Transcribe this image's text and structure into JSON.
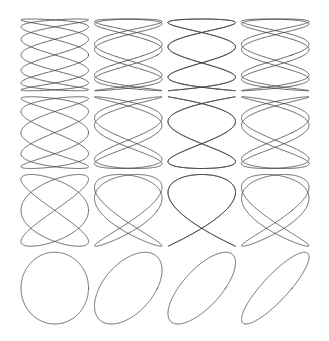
{
  "figure": {
    "background_color": "#ffffff",
    "stroke_color": "#3c3c3c",
    "stroke_width": 0.8,
    "canvas": {
      "width": 329,
      "height": 341
    },
    "grid": {
      "rows": 4,
      "cols": 4
    }
  },
  "chart_data": {
    "type": "line",
    "title": "",
    "subtitle": "",
    "xlabel": "",
    "ylabel": "",
    "grid": false,
    "legend": "none",
    "axis_visible": false,
    "tick_labels": [],
    "parametric": true,
    "equations": {
      "x": "A * sin(a * t + delta)",
      "y": "B * sin(b * t)",
      "t_range": [
        0,
        6.283185307179586
      ],
      "samples": 1200
    },
    "plot_area": {
      "x0": 18,
      "y0": 16,
      "x1": 312,
      "y1": 327
    },
    "cell_size": {
      "width": 73.5,
      "height": 77.75
    },
    "cell_padding": 3,
    "row_frequency_ratios": [
      "7:2",
      "5:2",
      "3:2",
      "1:1"
    ],
    "col_phase_deltas_deg": [
      90,
      60,
      45,
      30
    ],
    "panels": [
      {
        "row": 0,
        "col": 0,
        "a": 7,
        "b": 2,
        "delta_deg": 90,
        "ratio": "7:2"
      },
      {
        "row": 0,
        "col": 1,
        "a": 7,
        "b": 2,
        "delta_deg": 60,
        "ratio": "7:2"
      },
      {
        "row": 0,
        "col": 2,
        "a": 7,
        "b": 2,
        "delta_deg": 45,
        "ratio": "7:2"
      },
      {
        "row": 0,
        "col": 3,
        "a": 7,
        "b": 2,
        "delta_deg": 30,
        "ratio": "7:2"
      },
      {
        "row": 1,
        "col": 0,
        "a": 5,
        "b": 2,
        "delta_deg": 90,
        "ratio": "5:2"
      },
      {
        "row": 1,
        "col": 1,
        "a": 5,
        "b": 2,
        "delta_deg": 60,
        "ratio": "5:2"
      },
      {
        "row": 1,
        "col": 2,
        "a": 5,
        "b": 2,
        "delta_deg": 45,
        "ratio": "5:2"
      },
      {
        "row": 1,
        "col": 3,
        "a": 5,
        "b": 2,
        "delta_deg": 30,
        "ratio": "5:2"
      },
      {
        "row": 2,
        "col": 0,
        "a": 3,
        "b": 2,
        "delta_deg": 90,
        "ratio": "3:2"
      },
      {
        "row": 2,
        "col": 1,
        "a": 3,
        "b": 2,
        "delta_deg": 60,
        "ratio": "3:2"
      },
      {
        "row": 2,
        "col": 2,
        "a": 3,
        "b": 2,
        "delta_deg": 45,
        "ratio": "3:2"
      },
      {
        "row": 2,
        "col": 3,
        "a": 3,
        "b": 2,
        "delta_deg": 30,
        "ratio": "3:2"
      },
      {
        "row": 3,
        "col": 0,
        "a": 1,
        "b": 1,
        "delta_deg": 90,
        "ratio": "1:1"
      },
      {
        "row": 3,
        "col": 1,
        "a": 1,
        "b": 1,
        "delta_deg": 60,
        "ratio": "1:1"
      },
      {
        "row": 3,
        "col": 2,
        "a": 1,
        "b": 1,
        "delta_deg": 45,
        "ratio": "1:1"
      },
      {
        "row": 3,
        "col": 3,
        "a": 1,
        "b": 1,
        "delta_deg": 30,
        "ratio": "1:1"
      }
    ]
  }
}
